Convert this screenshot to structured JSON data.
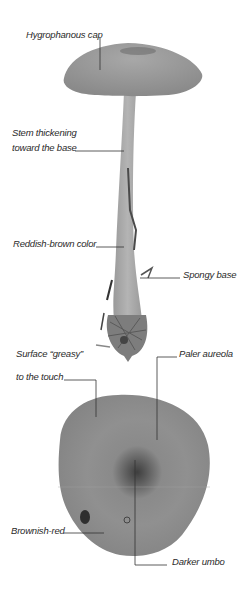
{
  "figure": {
    "colors": {
      "background": "#ffffff",
      "cap": "#9c9c9c",
      "stem": "#a6a6a6",
      "base": "#7a7a7a",
      "cap_top_view": "#8e8e8e",
      "umbo": "#3c3c3c",
      "leader_line": "#333333",
      "label_text": "#2a2a2a"
    }
  },
  "labels": {
    "hygrophanous_cap": "Hygrophanous cap",
    "stem_thickening_line1": "Stem thickening",
    "stem_thickening_line2": "toward the base",
    "reddish_brown": "Reddish-brown color",
    "spongy_base": "Spongy base",
    "surface_greasy_line1": "Surface “greasy”",
    "surface_greasy_line2": "to the touch",
    "paler_aureola": "Paler aureola",
    "brownish_red": "Brownish-red",
    "darker_umbo": "Darker umbo"
  }
}
